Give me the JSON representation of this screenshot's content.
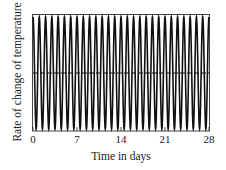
{
  "chart_data": {
    "type": "line",
    "title": "",
    "xlabel": "Time in days",
    "ylabel": "Rate of change of temperature",
    "xlim": [
      0,
      28
    ],
    "xticks": [
      0,
      7,
      14,
      21,
      28
    ],
    "xtick_labels": [
      "0",
      "7",
      "14",
      "21",
      "28"
    ],
    "yticks": [],
    "grid": false,
    "legend": null,
    "series": [
      {
        "name": "rate of change",
        "style": "solid",
        "description": "Sinusoidal oscillation, approximately one full cycle per day, constant amplitude",
        "period_days": 1,
        "cycles": 28,
        "amplitude_relative": 1.0,
        "mean": 0
      },
      {
        "name": "zero line",
        "style": "dashed",
        "value": 0
      }
    ],
    "colors": {
      "line": "#111111",
      "axes": "#333333",
      "background": "#ffffff"
    }
  }
}
